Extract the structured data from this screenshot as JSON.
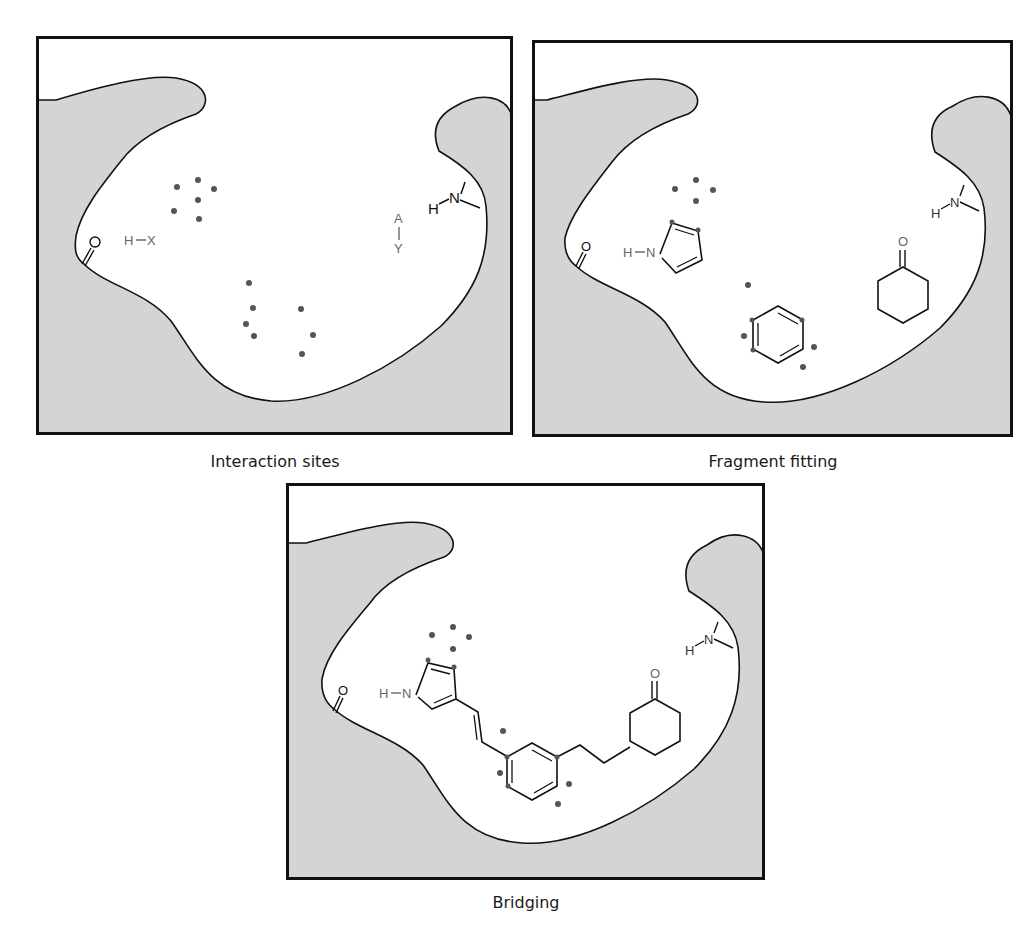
{
  "figure": {
    "colors": {
      "protein": "#d4d4d4",
      "outline": "#111111",
      "dot": "#555555",
      "label": "#666666",
      "frame": "#111111"
    },
    "panels": [
      {
        "id": "interaction-sites",
        "caption": "Interaction sites",
        "labels": {
          "hx_h": "H",
          "hx_x": "X",
          "ay_a": "A",
          "ay_y": "Y",
          "nh_n": "N",
          "nh_h": "H",
          "carbonyl_o": "O"
        }
      },
      {
        "id": "fragment-fitting",
        "caption": "Fragment fitting",
        "labels": {
          "pyrrole_h": "H",
          "pyrrole_n": "N",
          "ketone_o": "O",
          "nh_n": "N",
          "nh_h": "H",
          "carbonyl_o": "O"
        }
      },
      {
        "id": "bridging",
        "caption": "Bridging",
        "labels": {
          "pyrrole_h": "H",
          "pyrrole_n": "N",
          "ketone_o": "O",
          "nh_n": "N",
          "nh_h": "H",
          "carbonyl_o": "O"
        }
      }
    ]
  }
}
